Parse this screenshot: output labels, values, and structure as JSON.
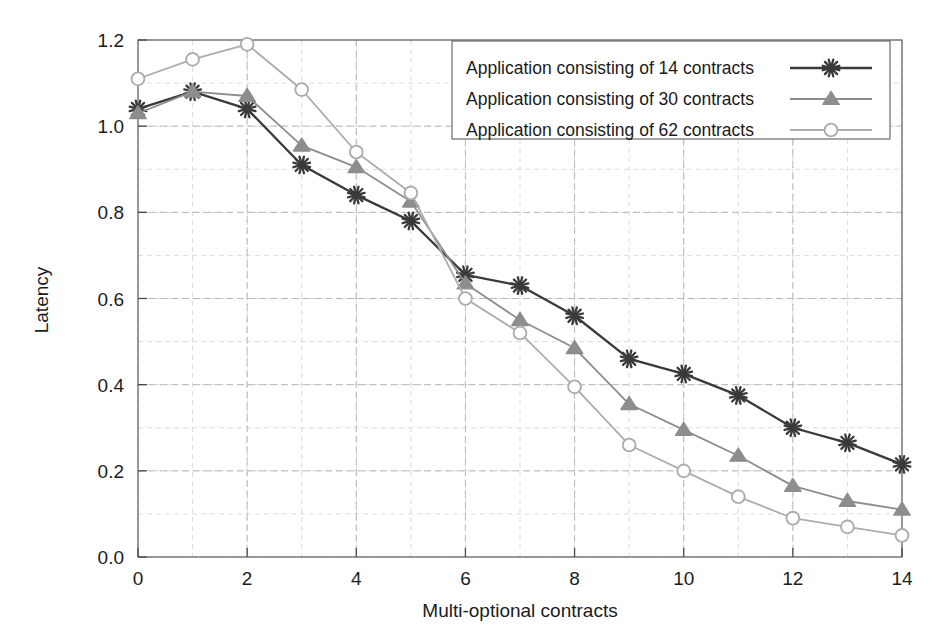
{
  "chart_data": {
    "type": "line",
    "title": "",
    "xlabel": "Multi-optional contracts",
    "ylabel": "Latency",
    "xlim": [
      0,
      14
    ],
    "ylim": [
      0.0,
      1.2
    ],
    "xticks": [
      0,
      2,
      4,
      6,
      8,
      10,
      12,
      14
    ],
    "xtick_labels": [
      "0",
      "2",
      "4",
      "6",
      "8",
      "10",
      "12",
      "14"
    ],
    "yticks": [
      0.0,
      0.2,
      0.4,
      0.6,
      0.8,
      1.0,
      1.2
    ],
    "ytick_labels": [
      "0.0",
      "0.2",
      "0.4",
      "0.6",
      "0.8",
      "1.0",
      "1.2"
    ],
    "grid": true,
    "grid_minor_y_step": 0.1,
    "grid_minor_x_step": 1,
    "legend_position": "top-right",
    "x": [
      0,
      1,
      2,
      3,
      4,
      5,
      6,
      7,
      8,
      9,
      10,
      11,
      12,
      13,
      14
    ],
    "series": [
      {
        "name": "Application consisting of 14 contracts",
        "marker": "asterisk",
        "color": "#3a3a3a",
        "values": [
          1.04,
          1.08,
          1.04,
          0.91,
          0.84,
          0.78,
          0.655,
          0.63,
          0.56,
          0.46,
          0.425,
          0.375,
          0.3,
          0.265,
          0.215
        ]
      },
      {
        "name": "Application consisting of 30 contracts",
        "marker": "triangle",
        "color": "#8d8d8d",
        "values": [
          1.03,
          1.08,
          1.07,
          0.955,
          0.905,
          0.825,
          0.635,
          0.55,
          0.485,
          0.355,
          0.295,
          0.235,
          0.165,
          0.13,
          0.11
        ]
      },
      {
        "name": "Application consisting of 62 contracts",
        "marker": "circle",
        "color": "#adadad",
        "values": [
          1.11,
          1.155,
          1.19,
          1.085,
          0.94,
          0.845,
          0.6,
          0.52,
          0.395,
          0.26,
          0.2,
          0.14,
          0.09,
          0.07,
          0.05
        ]
      }
    ]
  },
  "legend": {
    "entries": [
      "Application consisting of 14 contracts",
      "Application consisting of 30 contracts",
      "Application consisting of 62 contracts"
    ]
  },
  "colors": {
    "series_1": "#3a3a3a",
    "series_2": "#8d8d8d",
    "series_3": "#adadad",
    "axis": "#555555",
    "grid_major": "#b9b9b9",
    "grid_minor": "#d4d4d4",
    "text": "#1c1c1c",
    "background": "#ffffff"
  }
}
